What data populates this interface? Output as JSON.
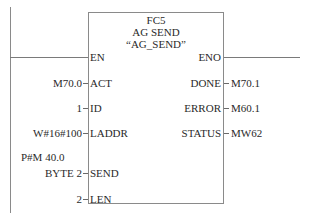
{
  "block": {
    "number": "FC5",
    "name": "AG SEND",
    "symbol": "“AG_SEND”"
  },
  "inputs": [
    {
      "pin": "EN",
      "value": ""
    },
    {
      "pin": "ACT",
      "value": "M70.0"
    },
    {
      "pin": "ID",
      "value": "1"
    },
    {
      "pin": "LADDR",
      "value": "W#16#100"
    },
    {
      "pin": "SEND",
      "value": "BYTE 2",
      "value_prefix": "P#M 40.0"
    },
    {
      "pin": "LEN",
      "value": "2"
    }
  ],
  "outputs": [
    {
      "pin": "ENO",
      "value": ""
    },
    {
      "pin": "DONE",
      "value": "M70.1"
    },
    {
      "pin": "ERROR",
      "value": "M60.1"
    },
    {
      "pin": "STATUS",
      "value": "MW62"
    }
  ],
  "colors": {
    "lines": "#8a8a8a",
    "text": "#2a2a2a",
    "background": "#ffffff"
  }
}
